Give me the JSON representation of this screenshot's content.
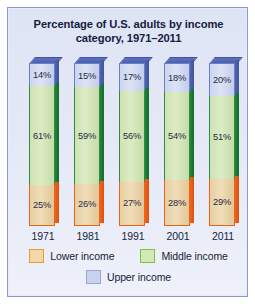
{
  "chart_data": {
    "type": "bar",
    "subtype": "stacked-column-100",
    "title": "Percentage of U.S. adults by income category, 1971–2011",
    "title_line1": "Percentage of U.S. adults by income",
    "title_line2": "category, 1971–2011",
    "xlabel": "",
    "ylabel": "",
    "ylim": [
      0,
      100
    ],
    "grid": false,
    "legend_position": "bottom",
    "categories": [
      "1971",
      "1981",
      "1991",
      "2001",
      "2011"
    ],
    "series": [
      {
        "name": "Upper income",
        "color": "#ccd5ef",
        "border_color": "#6b7fc4",
        "values": [
          14,
          15,
          17,
          18,
          20
        ],
        "labels": [
          "14%",
          "15%",
          "17%",
          "18%",
          "20%"
        ]
      },
      {
        "name": "Middle income",
        "color": "#d3e9b4",
        "border_color": "#2f8c3f",
        "values": [
          61,
          59,
          56,
          54,
          51
        ],
        "labels": [
          "61%",
          "59%",
          "56%",
          "54%",
          "51%"
        ]
      },
      {
        "name": "Lower income",
        "color": "#f3d7a4",
        "border_color": "#e8641a",
        "values": [
          25,
          26,
          27,
          28,
          29
        ],
        "labels": [
          "25%",
          "26%",
          "27%",
          "28%",
          "29%"
        ]
      }
    ],
    "legend": [
      {
        "label": "Lower income",
        "color": "#f3d7a4"
      },
      {
        "label": "Middle income",
        "color": "#d3e9b4"
      },
      {
        "label": "Upper income",
        "color": "#c9d2ec"
      }
    ]
  },
  "colors": {
    "panel_background": "#e4e8f6",
    "panel_border": "#8c9ad4",
    "title_text": "#14213e",
    "axis_text": "#17233c",
    "upper_income": "#ccd5ef",
    "middle_income": "#d3e9b4",
    "lower_income": "#f3d7a4"
  }
}
